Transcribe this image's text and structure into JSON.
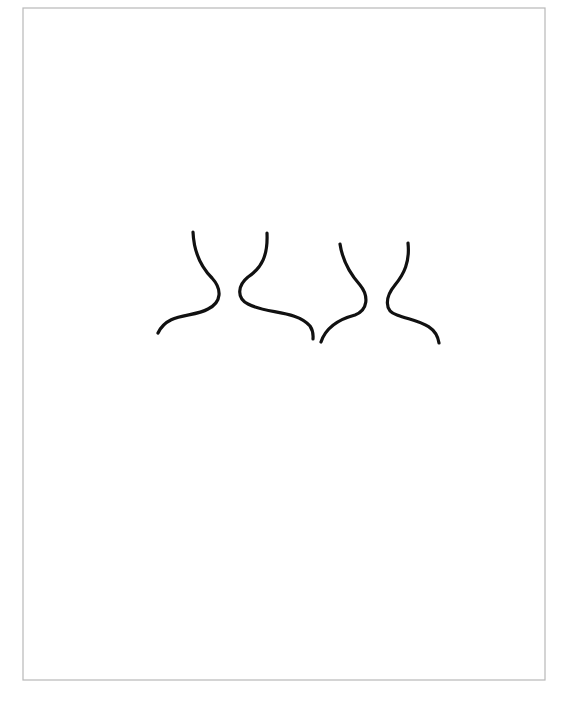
{
  "page": {
    "background": "#ffffff",
    "frame_color": "#b8b8b8",
    "ink_color": "#111111"
  },
  "drawing": {
    "description": "Two pairs of neck-and-shoulder outline curves",
    "frame": {
      "x": "23",
      "y": "8",
      "width": "522",
      "height": "672"
    },
    "figures": [
      {
        "label": "figure-1",
        "left_contour": "M193,232 C194,255 202,268 212,278 C222,289 222,302 208,309 C192,318 168,312 158,333",
        "right_contour": "M267,233 C268,255 262,268 248,277 C238,285 236,298 248,304 C266,314 296,310 310,326 C314,332 313,337 313,339"
      },
      {
        "label": "figure-2",
        "left_contour": "M340,244 C343,264 352,276 360,285 C369,296 368,310 355,315 C336,320 325,330 321,342",
        "right_contour": "M408,243 C410,262 404,274 395,285 C385,297 384,311 397,315 C416,322 436,323 439,343"
      }
    ]
  }
}
